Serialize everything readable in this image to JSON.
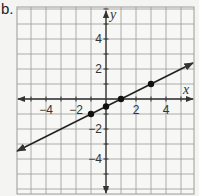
{
  "problem_label": "b.",
  "chart_data": {
    "type": "line",
    "title": "",
    "xlabel": "x",
    "ylabel": "y",
    "xlim": [
      -6,
      6
    ],
    "ylim": [
      -6.3,
      6.1
    ],
    "grid": true,
    "x_tick_labels": [
      "−4",
      "−2",
      "2",
      "4"
    ],
    "x_ticks": [
      -4,
      -2,
      2,
      4
    ],
    "y_tick_labels": [
      "4",
      "2",
      "−2",
      "−4"
    ],
    "y_ticks": [
      4,
      2,
      -2,
      -4
    ],
    "line": {
      "equation": "y = 0.5x - 0.5",
      "slope": 0.5,
      "intercept": -0.5,
      "arrows_both_ends": true,
      "x_range": [
        -5.93,
        5.8
      ]
    },
    "points": [
      {
        "x": -1,
        "y": -1
      },
      {
        "x": 0,
        "y": -0.5
      },
      {
        "x": 1,
        "y": 0
      },
      {
        "x": 3,
        "y": 1
      }
    ],
    "colors": {
      "grid": "#9a9a9a",
      "axis": "#333333",
      "line": "#222222",
      "point": "#111111",
      "background": "#f4f4f2"
    }
  }
}
